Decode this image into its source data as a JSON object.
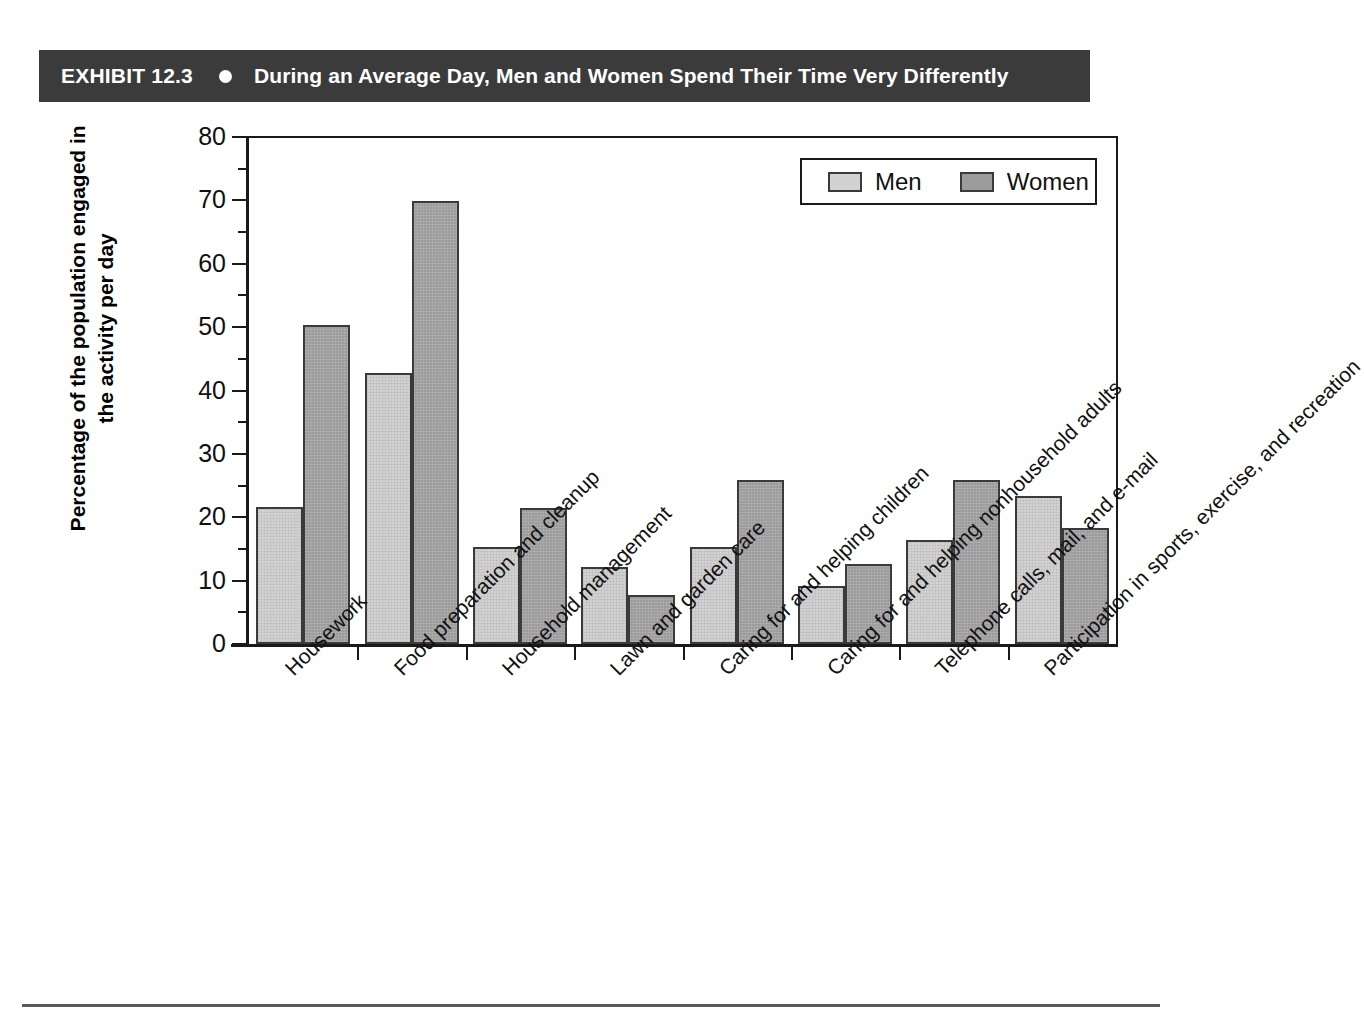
{
  "exhibit": {
    "label": "EXHIBIT 12.3",
    "bullet_icon": "filled-circle-icon",
    "title": "During an Average Day, Men and Women Spend Their Time Very Differently",
    "header_bg": "#3b3b3b",
    "header_fg": "#ffffff"
  },
  "chart_data": {
    "type": "bar",
    "title": "During an Average Day, Men and Women Spend Their Time Very Differently",
    "xlabel": "",
    "ylabel": "Percentage of the population engaged in the activity per day",
    "ylabel_line1": "Percentage of the population engaged in",
    "ylabel_line2": "the activity per day",
    "ylim": [
      0,
      80
    ],
    "yticks": [
      0,
      10,
      20,
      30,
      40,
      50,
      60,
      70,
      80
    ],
    "ytick_labels": [
      "0",
      "10",
      "20",
      "30",
      "40",
      "50",
      "60",
      "70",
      "80"
    ],
    "grid": false,
    "legend_position": "top-right",
    "categories": [
      "Housework",
      "Food preparation and cleanup",
      "Household management",
      "Lawn and garden care",
      "Caring for and helping children",
      "Caring for and helping nonhousehold adults",
      "Telephone calls, mail, and e-mail",
      "Participation in sports, exercise, and recreation"
    ],
    "series": [
      {
        "name": "Men",
        "color": "#d2d2d2",
        "values": [
          21.6,
          42.8,
          15.3,
          12.2,
          15.3,
          9.2,
          16.4,
          23.3
        ]
      },
      {
        "name": "Women",
        "color": "#9b9b9b",
        "values": [
          50.4,
          69.9,
          21.5,
          7.8,
          25.9,
          12.7,
          25.9,
          18.3
        ]
      }
    ]
  },
  "legend": {
    "items": [
      {
        "label": "Men",
        "color": "#d2d2d2"
      },
      {
        "label": "Women",
        "color": "#9b9b9b"
      }
    ]
  }
}
